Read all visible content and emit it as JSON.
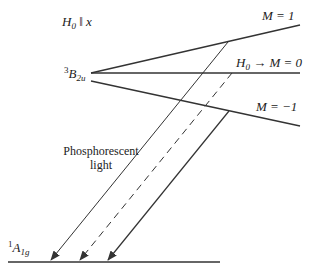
{
  "field_label": {
    "symbol": "H",
    "subscript": "0",
    "rest": "‖ x"
  },
  "excited_state": {
    "sup": "3",
    "symbol": "B",
    "sub": "2u"
  },
  "ground_state": {
    "sup": "1",
    "symbol": "A",
    "sub": "1g"
  },
  "levels": {
    "m_plus": "M = 1",
    "m_zero_prefix_symbol": "H",
    "m_zero_prefix_sub": "0",
    "m_zero_arrow": "→",
    "m_zero": "M = 0",
    "m_minus": "M = −1"
  },
  "emission_label": {
    "line1": "Phosphorescent",
    "line2": "light"
  },
  "colors": {
    "line": "#333333",
    "text": "#222222",
    "background": "#ffffff"
  }
}
